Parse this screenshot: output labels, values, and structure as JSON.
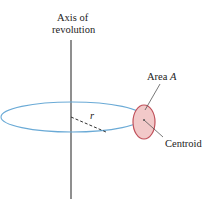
{
  "diagram": {
    "axis_label_line1": "Axis of",
    "axis_label_line2": "revolution",
    "area_label": "Area",
    "area_symbol": "A",
    "radius_label": "r",
    "centroid_label": "Centroid",
    "colors": {
      "axis": "#333333",
      "orbit": "#6aaad6",
      "area_fill": "#f2c9c9",
      "area_stroke": "#c0505a",
      "leader": "#555555"
    }
  }
}
